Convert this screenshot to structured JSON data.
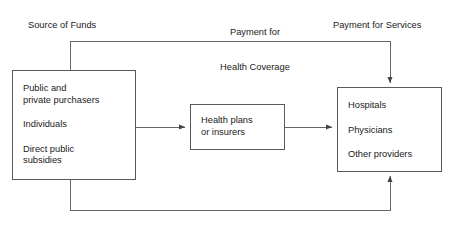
{
  "diagram": {
    "title_labels": {
      "source_of_funds": "Source of Funds",
      "payment_for_health_coverage": "Payment for\nHealth Coverage",
      "payment_for_health_coverage_line1": "Payment for",
      "payment_for_health_coverage_line2": "Health Coverage",
      "payment_for_services": "Payment for Services"
    },
    "nodes": [
      {
        "id": "purchasers",
        "lines": [
          "Public and",
          "private purchasers",
          "Individuals",
          "Direct public",
          "subsidies"
        ],
        "line1": "Public and",
        "line2": "private purchasers",
        "line3": "Individuals",
        "line4": "Direct public",
        "line5": "subsidies"
      },
      {
        "id": "health-plans",
        "lines": [
          "Health plans",
          "or insurers"
        ],
        "line1": "Health plans",
        "line2": "or insurers"
      },
      {
        "id": "providers",
        "lines": [
          "Hospitals",
          "Physicians",
          "Other providers"
        ],
        "line1": "Hospitals",
        "line2": "Physicians",
        "line3": "Other providers"
      }
    ],
    "edges": [
      {
        "id": "purchasers-to-health-plans",
        "from": "purchasers",
        "to": "health-plans",
        "label": "Payment for Health Coverage",
        "style": "straight-arrow"
      },
      {
        "id": "health-plans-to-providers",
        "from": "health-plans",
        "to": "providers",
        "label": "Payment for Services",
        "style": "straight-arrow"
      },
      {
        "id": "purchasers-top-to-providers-top",
        "from": "purchasers",
        "to": "providers",
        "label": "Payment for Health Coverage",
        "style": "elbow-over-top"
      },
      {
        "id": "purchasers-bottom-to-providers-bottom",
        "from": "purchasers",
        "to": "providers",
        "label": "Payment for Services",
        "style": "elbow-under-bottom"
      }
    ],
    "colors": {
      "background": "#ffffff",
      "stroke": "#595959",
      "text": "#1a1a1a"
    }
  }
}
